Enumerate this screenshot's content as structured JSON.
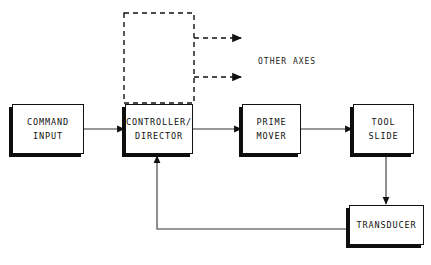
{
  "diagram": {
    "background_color": "#ffffff",
    "ink_color": "#111111",
    "nodes": [
      {
        "id": "command_input",
        "lines": [
          "COMMAND",
          "INPUT"
        ],
        "x": 12,
        "y": 104,
        "w": 72,
        "h": 50
      },
      {
        "id": "controller_director",
        "lines": [
          "CONTROLLER/",
          "DIRECTOR"
        ],
        "x": 125,
        "y": 104,
        "w": 68,
        "h": 50
      },
      {
        "id": "prime_mover",
        "lines": [
          "PRIME",
          "MOVER"
        ],
        "x": 242,
        "y": 104,
        "w": 59,
        "h": 50
      },
      {
        "id": "tool_slide",
        "lines": [
          "TOOL",
          "SLIDE"
        ],
        "x": 353,
        "y": 104,
        "w": 61,
        "h": 50
      },
      {
        "id": "transducer",
        "lines": [
          "TRANSDUCER"
        ],
        "x": 349,
        "y": 205,
        "w": 75,
        "h": 40
      }
    ],
    "labels": [
      {
        "id": "other_axes",
        "text": "OTHER AXES",
        "x": 258,
        "y": 57
      }
    ],
    "dashed_group": {
      "id": "other-axes-group",
      "x": 124,
      "y": 13,
      "w": 70,
      "h": 90,
      "note": "dashed rectangle above controller/director indicating replicated axis modules"
    },
    "connectors": [
      {
        "id": "command-to-controller",
        "from": "command_input",
        "to": "controller_director",
        "style": "solid",
        "arrow": true
      },
      {
        "id": "controller-to-prime",
        "from": "controller_director",
        "to": "prime_mover",
        "style": "solid",
        "arrow": true
      },
      {
        "id": "prime-to-tool",
        "from": "prime_mover",
        "to": "tool_slide",
        "style": "solid",
        "arrow": true
      },
      {
        "id": "tool-to-transducer",
        "from": "tool_slide",
        "to": "transducer",
        "style": "solid",
        "arrow": true
      },
      {
        "id": "transducer-feedback",
        "from": "transducer",
        "to": "controller_director",
        "style": "solid",
        "arrow": true
      },
      {
        "id": "group-to-other-axes-1",
        "from": "other-axes-group",
        "to": "other_axes",
        "style": "dashed",
        "arrow": true
      },
      {
        "id": "group-to-other-axes-2",
        "from": "other-axes-group",
        "to": "other_axes",
        "style": "dashed",
        "arrow": true
      }
    ]
  }
}
